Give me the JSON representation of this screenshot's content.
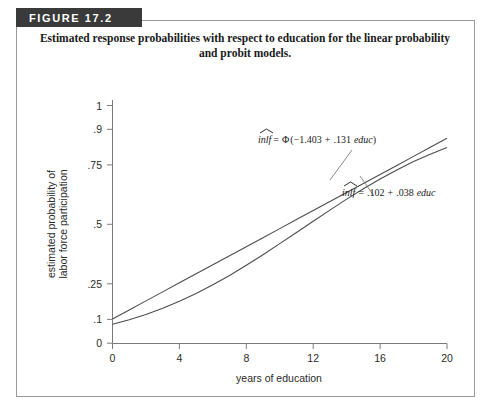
{
  "figure": {
    "tab_label": "FIGURE 17.2",
    "caption_line1": "Estimated response probabilities with respect to education for the linear probability",
    "caption_line2": "and probit models.",
    "border_color": "#9a9a9a",
    "tab_bg": "#3a3a3a",
    "curve_color": "#4d4d4d",
    "axis_color": "#7a7a7a"
  },
  "chart_data": {
    "type": "line",
    "title": "Estimated response probabilities with respect to education for the linear probability and probit models.",
    "xlabel": "years of education",
    "ylabel_line1": "estimated probability of",
    "ylabel_line2": "labor force participation",
    "xlim": [
      0,
      20
    ],
    "ylim": [
      0,
      1
    ],
    "grid": false,
    "legend_position": "inline-annotation",
    "xticks": [
      0,
      4,
      8,
      12,
      16,
      20
    ],
    "xtick_labels": [
      "0",
      "4",
      "8",
      "12",
      "16",
      "20"
    ],
    "yticks": [
      0,
      0.1,
      0.25,
      0.5,
      0.75,
      0.9,
      1
    ],
    "ytick_labels": [
      "0",
      ".1",
      ".25",
      ".5",
      ".75",
      ".9",
      "1"
    ],
    "x": [
      0,
      1,
      2,
      3,
      4,
      5,
      6,
      7,
      8,
      9,
      10,
      11,
      12,
      13,
      14,
      15,
      16,
      17,
      18,
      19,
      20
    ],
    "series": [
      {
        "name": "probit",
        "equation_parts": {
          "lhs": "inlf",
          "eq": "=",
          "fn": "Φ",
          "open": "(",
          "intercept": "−1.403",
          "plus": "+",
          "slope": ".131",
          "var": "educ",
          "close": ")"
        },
        "equation_text": "inlf̂ = Φ(−1.403 + .131 educ)",
        "intercept": -1.403,
        "slope": 0.131,
        "values": [
          0.08,
          0.099,
          0.121,
          0.147,
          0.176,
          0.209,
          0.246,
          0.285,
          0.328,
          0.372,
          0.419,
          0.466,
          0.513,
          0.56,
          0.606,
          0.65,
          0.691,
          0.729,
          0.764,
          0.795,
          0.823
        ]
      },
      {
        "name": "linear probability",
        "equation_parts": {
          "lhs": "inlf",
          "eq": "=",
          "intercept": ".102",
          "plus": "+",
          "slope": ".038",
          "var": "educ"
        },
        "equation_text": "inlf̂ = .102 + .038 educ",
        "intercept": 0.102,
        "slope": 0.038,
        "values": [
          0.102,
          0.14,
          0.178,
          0.216,
          0.254,
          0.292,
          0.33,
          0.368,
          0.406,
          0.444,
          0.482,
          0.52,
          0.558,
          0.596,
          0.634,
          0.672,
          0.71,
          0.748,
          0.786,
          0.824,
          0.862
        ]
      }
    ]
  }
}
